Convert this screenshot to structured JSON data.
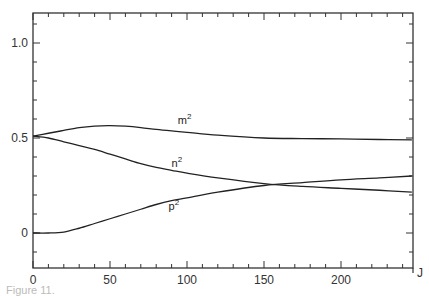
{
  "chart_data": {
    "type": "line",
    "title": "",
    "xlabel": "J",
    "ylabel": "",
    "xlim": [
      0,
      246
    ],
    "ylim": [
      -0.18,
      1.16
    ],
    "x_ticks": [
      0,
      50,
      100,
      150,
      200
    ],
    "y_ticks": [
      0,
      0.5,
      1.0
    ],
    "x_tick_labels": [
      "0",
      "50",
      "100",
      "150",
      "200"
    ],
    "y_tick_labels": [
      "0",
      "0.5",
      "1.0"
    ],
    "grid": false,
    "legend": "inline curve labels",
    "x": [
      0,
      10,
      20,
      30,
      40,
      50,
      60,
      70,
      80,
      90,
      100,
      120,
      150,
      175,
      200,
      225,
      246
    ],
    "series": [
      {
        "name": "m²",
        "label_base": "m",
        "label_sup": "2",
        "values": [
          0.51,
          0.525,
          0.54,
          0.555,
          0.563,
          0.565,
          0.562,
          0.555,
          0.545,
          0.537,
          0.53,
          0.515,
          0.5,
          0.497,
          0.495,
          0.492,
          0.49
        ]
      },
      {
        "name": "n²",
        "label_base": "n",
        "label_sup": "2",
        "values": [
          0.51,
          0.5,
          0.48,
          0.46,
          0.44,
          0.415,
          0.39,
          0.365,
          0.345,
          0.33,
          0.315,
          0.29,
          0.26,
          0.245,
          0.235,
          0.225,
          0.215
        ]
      },
      {
        "name": "p²",
        "label_base": "p",
        "label_sup": "2",
        "values": [
          0.0,
          0.0,
          0.005,
          0.025,
          0.05,
          0.075,
          0.1,
          0.125,
          0.15,
          0.17,
          0.185,
          0.215,
          0.25,
          0.265,
          0.28,
          0.29,
          0.3
        ]
      }
    ]
  },
  "axis": {
    "x_end_label": "J"
  },
  "caption": "Figure 11."
}
